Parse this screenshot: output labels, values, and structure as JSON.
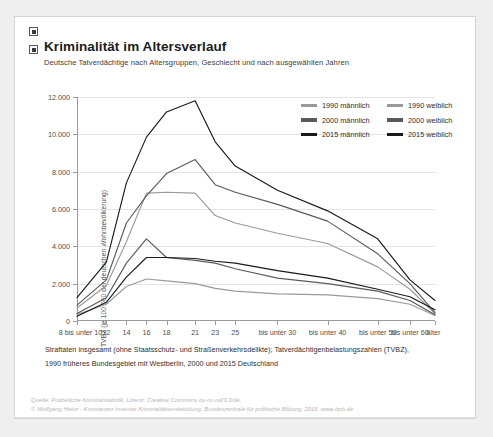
{
  "card": {
    "title": "Kriminalität im Altersverlauf",
    "subtitle": "Deutsche Tatverdächtige nach Altersgruppen, Geschlecht und nach ausgewählten Jahren",
    "footnote_line1": "Straftaten insgesamt (ohne Staatsschutz- und Straßenverkehrsdelikte); Tatverdächtigenbelastungszahlen (TVBZ),",
    "footnote_line2": "1990 früheres Bundesgebiet mit Westberlin, 2000 und 2015 Deutschland",
    "source_line1": "Quelle: Polizeiliche Kriminalstatistik, Lizenz: Creative Commons by-nc-nd/3.0/de.",
    "source_line2": "© Wolfgang Heinz - Konstanzer Inventar Kriminalitätsentwicklung, Bundeszentrale für politische Bildung, 2016, www.bpb.de"
  },
  "legend": {
    "rows": [
      [
        {
          "label": "1990 männlich",
          "color": "#9a9a9a"
        },
        {
          "label": "1990 weiblich",
          "color": "#9a9a9a"
        }
      ],
      [
        {
          "label": "2000 männlich",
          "color": "#5a5a5a"
        },
        {
          "label": "2000 weiblich",
          "color": "#5a5a5a"
        }
      ],
      [
        {
          "label": "2015 männlich",
          "color": "#1a1a1a"
        },
        {
          "label": "2015 weiblich",
          "color": "#1a1a1a"
        }
      ]
    ]
  },
  "chart_data": {
    "type": "line",
    "title": "Kriminalität im Altersverlauf",
    "subtitle": "Deutsche Tatverdächtige nach Altersgruppen, Geschlecht und nach ausgewählten Jahren",
    "xlabel": "",
    "ylabel": "TVBZ (je 100 000 der deutschen Wohnbevölkerung)",
    "ylim": [
      0,
      12000
    ],
    "yticks": [
      0,
      2000,
      4000,
      6000,
      8000,
      10000,
      12000
    ],
    "ytick_labels": [
      "0",
      "2.000",
      "4.000",
      "6.000",
      "8.000",
      "10.000",
      "12.000"
    ],
    "grid": true,
    "legend_position": "top-right",
    "categories": [
      "8 bis unter 10",
      "12",
      "14",
      "16",
      "18",
      "21",
      "23",
      "25",
      "bis unter 30",
      "bis unter 40",
      "bis unter 50",
      "bis unter 60",
      "älter"
    ],
    "series": [
      {
        "name": "1990 männlich",
        "color": "#9a9a9a",
        "values": [
          700,
          1900,
          4250,
          6850,
          6900,
          6850,
          5650,
          5250,
          4700,
          4150,
          2900,
          1700,
          400
        ]
      },
      {
        "name": "1990 weiblich",
        "color": "#9a9a9a",
        "values": [
          340,
          900,
          1850,
          2250,
          2150,
          2000,
          1750,
          1600,
          1450,
          1400,
          1200,
          900,
          300
        ]
      },
      {
        "name": "2000 männlich",
        "color": "#5a5a5a",
        "values": [
          850,
          2200,
          5250,
          6700,
          7900,
          8650,
          7300,
          6900,
          6250,
          5350,
          3600,
          2000,
          450
        ]
      },
      {
        "name": "2000 weiblich",
        "color": "#5a5a5a",
        "values": [
          400,
          1250,
          3100,
          4400,
          3400,
          3250,
          3100,
          2800,
          2300,
          2000,
          1600,
          1100,
          330
        ]
      },
      {
        "name": "2015 männlich",
        "color": "#1a1a1a",
        "values": [
          1250,
          3150,
          7400,
          9850,
          11200,
          11800,
          9600,
          8300,
          7000,
          5900,
          4400,
          2200,
          1100
        ]
      },
      {
        "name": "2015 weiblich",
        "color": "#1a1a1a",
        "values": [
          250,
          1000,
          2350,
          3400,
          3400,
          3350,
          3200,
          3100,
          2700,
          2300,
          1700,
          1300,
          600
        ]
      }
    ]
  }
}
